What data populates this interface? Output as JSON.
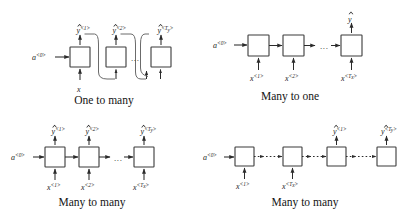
{
  "figure": {
    "background_color": "#ffffff",
    "ink_color": "#1a1a1a",
    "loop_color": "#6b6b6b",
    "ellipsis": "...",
    "panels": [
      {
        "id": "one-to-many",
        "caption": "One to many",
        "initial_activation": "a",
        "initial_activation_sup": "<0>",
        "single_input": "x",
        "cells": 3,
        "outputs": [
          {
            "base": "y",
            "sup": "<1>"
          },
          {
            "base": "y",
            "sup": "<2>"
          },
          {
            "base": "y",
            "sup": "<T",
            "sup_sub": "y",
            "sup_tail": ">"
          }
        ],
        "inputs": [],
        "has_feedback_loops": true
      },
      {
        "id": "many-to-one",
        "caption": "Many to one",
        "initial_activation": "a",
        "initial_activation_sup": "<0>",
        "cells": 3,
        "outputs": [
          {
            "base": "y",
            "sup": ""
          }
        ],
        "inputs": [
          {
            "base": "x",
            "sup": "<1>"
          },
          {
            "base": "x",
            "sup": "<2>"
          },
          {
            "base": "x",
            "sup": "<T",
            "sup_sub": "x",
            "sup_tail": ">"
          }
        ],
        "has_feedback_loops": false
      },
      {
        "id": "many-to-many-synced",
        "caption": "Many to many",
        "initial_activation": "a",
        "initial_activation_sup": "<0>",
        "cells": 3,
        "outputs": [
          {
            "base": "y",
            "sup": "<1>"
          },
          {
            "base": "y",
            "sup": "<2>"
          },
          {
            "base": "y",
            "sup": "<T",
            "sup_sub": "y",
            "sup_tail": ">"
          }
        ],
        "inputs": [
          {
            "base": "x",
            "sup": "<1>"
          },
          {
            "base": "x",
            "sup": "<2>"
          },
          {
            "base": "x",
            "sup": "<T",
            "sup_sub": "x",
            "sup_tail": ">"
          }
        ],
        "has_feedback_loops": false
      },
      {
        "id": "many-to-many-encoder-decoder",
        "caption": "Many to many",
        "initial_activation": "a",
        "initial_activation_sup": "<0>",
        "cells": 4,
        "outputs": [
          {
            "base": "y",
            "sup": "<1>"
          },
          {
            "base": "y",
            "sup": "<T",
            "sup_sub": "y",
            "sup_tail": ">"
          }
        ],
        "inputs": [
          {
            "base": "x",
            "sup": "<1>"
          },
          {
            "base": "x",
            "sup": "<T",
            "sup_sub": "x",
            "sup_tail": ">"
          }
        ],
        "has_feedback_loops": false
      }
    ]
  },
  "labels": {
    "p1_a0_base": "a",
    "p1_a0_sup": "<0>",
    "p1_y1_base": "y",
    "p1_y1_sup": "<1>",
    "p1_y2_base": "y",
    "p1_y2_sup": "<2>",
    "p1_y3_base": "y",
    "p1_y3_sup_pre": "<T",
    "p1_y3_sup_sub": "y",
    "p1_y3_sup_post": ">",
    "p1_x": "x",
    "p1_caption": "One to many",
    "p1_dots": "...",
    "p2_a0_base": "a",
    "p2_a0_sup": "<0>",
    "p2_y_base": "y",
    "p2_x1_base": "x",
    "p2_x1_sup": "<1>",
    "p2_x2_base": "x",
    "p2_x2_sup": "<2>",
    "p2_x3_base": "x",
    "p2_x3_sup_pre": "<T",
    "p2_x3_sup_sub": "x",
    "p2_x3_sup_post": ">",
    "p2_caption": "Many to one",
    "p2_dots": "...",
    "p3_a0_base": "a",
    "p3_a0_sup": "<0>",
    "p3_y1_base": "y",
    "p3_y1_sup": "<1>",
    "p3_y2_base": "y",
    "p3_y2_sup": "<2>",
    "p3_y3_base": "y",
    "p3_y3_sup_pre": "<T",
    "p3_y3_sup_sub": "y",
    "p3_y3_sup_post": ">",
    "p3_x1_base": "x",
    "p3_x1_sup": "<1>",
    "p3_x2_base": "x",
    "p3_x2_sup": "<2>",
    "p3_x3_base": "x",
    "p3_x3_sup_pre": "<T",
    "p3_x3_sup_sub": "x",
    "p3_x3_sup_post": ">",
    "p3_caption": "Many to many",
    "p3_dots": "...",
    "p4_a0_base": "a",
    "p4_a0_sup": "<0>",
    "p4_x1_base": "x",
    "p4_x1_sup": "<1>",
    "p4_x2_base": "x",
    "p4_x2_sup_pre": "<T",
    "p4_x2_sup_sub": "x",
    "p4_x2_sup_post": ">",
    "p4_y1_base": "y",
    "p4_y1_sup": "<1>",
    "p4_y2_base": "y",
    "p4_y2_sup_pre": "<T",
    "p4_y2_sup_sub": "y",
    "p4_y2_sup_post": ">",
    "p4_caption": "Many to many"
  }
}
